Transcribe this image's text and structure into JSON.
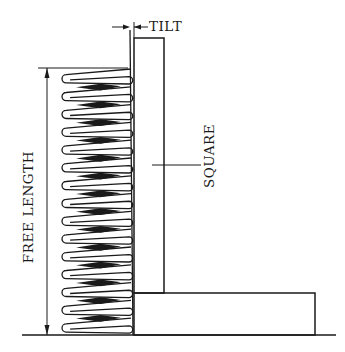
{
  "diagram": {
    "labels": {
      "tilt": "TILT",
      "square": "SQUARE",
      "free_length": "FREE LENGTH"
    },
    "spring": {
      "coil_count": 15
    },
    "colors": {
      "line": "#1a1a1a",
      "background": "#ffffff"
    }
  }
}
